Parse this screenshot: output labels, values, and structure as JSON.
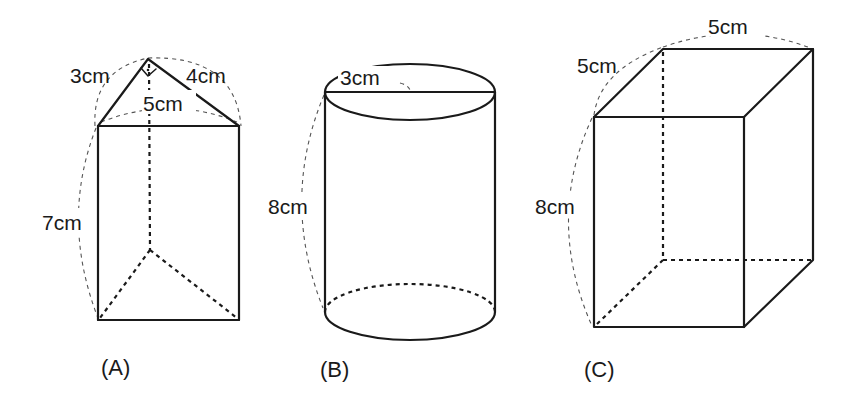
{
  "figures": {
    "a": {
      "caption": "(A)",
      "shape": "triangular prism",
      "labels": {
        "leg1": "3cm",
        "leg2": "4cm",
        "hypotenuse": "5cm",
        "height": "7cm"
      }
    },
    "b": {
      "caption": "(B)",
      "shape": "cylinder",
      "labels": {
        "radius": "3cm",
        "height": "8cm"
      }
    },
    "c": {
      "caption": "(C)",
      "shape": "rectangular prism",
      "labels": {
        "width": "5cm",
        "depth": "5cm",
        "height": "8cm"
      }
    }
  }
}
